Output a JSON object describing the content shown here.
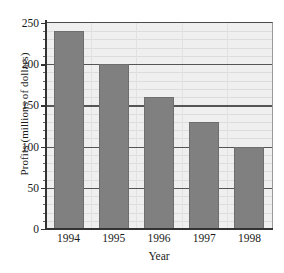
{
  "chart_data": {
    "type": "bar",
    "title": "",
    "xlabel": "Year",
    "ylabel": "Profits (millions of dollars)",
    "categories": [
      "1994",
      "1995",
      "1996",
      "1997",
      "1998"
    ],
    "values": [
      240,
      200,
      160,
      130,
      100
    ],
    "ylim": [
      0,
      250
    ],
    "xlim_note": "five categorical bars, evenly spaced",
    "ytick_labels": [
      "0",
      "50",
      "100",
      "150",
      "200",
      "250"
    ],
    "ytick_values": [
      0,
      50,
      100,
      150,
      200,
      250
    ],
    "minor_tick_step": 10,
    "grid": "horizontal major and minor gridlines, faint vertical gridlines",
    "legend": "none",
    "series": [
      {
        "name": "Profits",
        "values": [
          240,
          200,
          160,
          130,
          100
        ]
      }
    ],
    "colors": {
      "bar_fill": "#808080",
      "bar_edge": "#6e6e6e",
      "plot_background": "#efefef",
      "major_gridline": "#555555",
      "minor_gridline": "#dcdcdc",
      "axis": "#333333",
      "text": "#1a1a1a"
    }
  }
}
